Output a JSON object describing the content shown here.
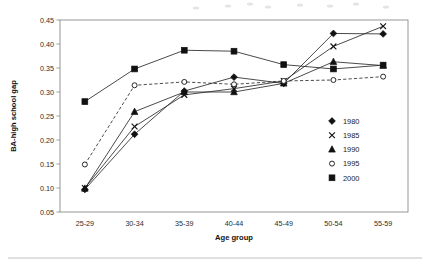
{
  "chart_data": {
    "type": "line",
    "title": "",
    "subtitle": "",
    "xlabel": "Age group",
    "ylabel": "BA-high school gap",
    "categories": [
      "25-29",
      "30-34",
      "35-39",
      "40-44",
      "45-49",
      "50-54",
      "55-59"
    ],
    "x": [
      0,
      1,
      2,
      3,
      4,
      5,
      6
    ],
    "ylim": [
      0.05,
      0.45
    ],
    "yticks": [
      0.05,
      0.1,
      0.15,
      0.2,
      0.25,
      0.3,
      0.35,
      0.4,
      0.45
    ],
    "ytick_labels": [
      "0.05",
      "0.10",
      "0.15",
      "0.20",
      "0.25",
      "0.30",
      "0.35",
      "0.40",
      "0.45"
    ],
    "grid": false,
    "legend_position": "inside-right",
    "series": [
      {
        "name": "1980",
        "marker": "filled-diamond",
        "linestyle": "solid",
        "values": [
          0.097,
          0.212,
          0.302,
          0.331,
          0.318,
          0.422,
          0.421
        ]
      },
      {
        "name": "1985",
        "marker": "cross",
        "linestyle": "solid",
        "values": [
          0.1,
          0.228,
          0.294,
          0.307,
          0.323,
          0.395,
          0.437
        ]
      },
      {
        "name": "1990",
        "marker": "filled-triangle",
        "linestyle": "solid",
        "values": [
          0.099,
          0.259,
          0.3,
          0.3,
          0.318,
          0.363,
          0.355
        ]
      },
      {
        "name": "1995",
        "marker": "open-circle",
        "linestyle": "dashed",
        "values": [
          0.149,
          0.314,
          0.321,
          0.316,
          0.323,
          0.325,
          0.332
        ]
      },
      {
        "name": "2000",
        "marker": "filled-square",
        "linestyle": "solid",
        "values": [
          0.28,
          0.348,
          0.387,
          0.385,
          0.357,
          0.348,
          0.356
        ]
      }
    ]
  },
  "legend": {
    "entries": [
      {
        "label": "1980",
        "marker": "filled-diamond"
      },
      {
        "label": "1985",
        "marker": "cross"
      },
      {
        "label": "1990",
        "marker": "filled-triangle"
      },
      {
        "label": "1995",
        "marker": "open-circle"
      },
      {
        "label": "2000",
        "marker": "filled-square"
      }
    ]
  },
  "colors": {
    "ink": "#1a1a1a",
    "frame": "#8a8a8a",
    "series": "#2a2a2a",
    "page": "#ffffff",
    "rule": "#b9b9b9"
  }
}
